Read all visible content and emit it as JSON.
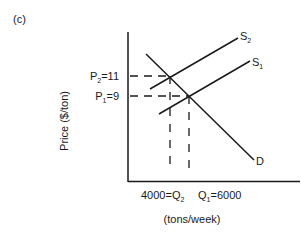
{
  "panel_label": "(c)",
  "y_axis": {
    "label": "Price ($/ton)"
  },
  "x_axis": {
    "label": "(tons/week)"
  },
  "price_levels": [
    {
      "name": "P",
      "sub": "2",
      "value": "=11"
    },
    {
      "name": "P",
      "sub": "1",
      "value": "=9"
    }
  ],
  "quantity_levels": [
    {
      "prefix": "4000=Q",
      "sub": "2"
    },
    {
      "name": "Q",
      "sub": "1",
      "value": "=6000"
    }
  ],
  "curves": {
    "supply2": {
      "name": "S",
      "sub": "2"
    },
    "supply1": {
      "name": "S",
      "sub": "1"
    },
    "demand": {
      "name": "D"
    }
  },
  "colors": {
    "line": "#1a1a1a",
    "background": "#ffffff"
  }
}
